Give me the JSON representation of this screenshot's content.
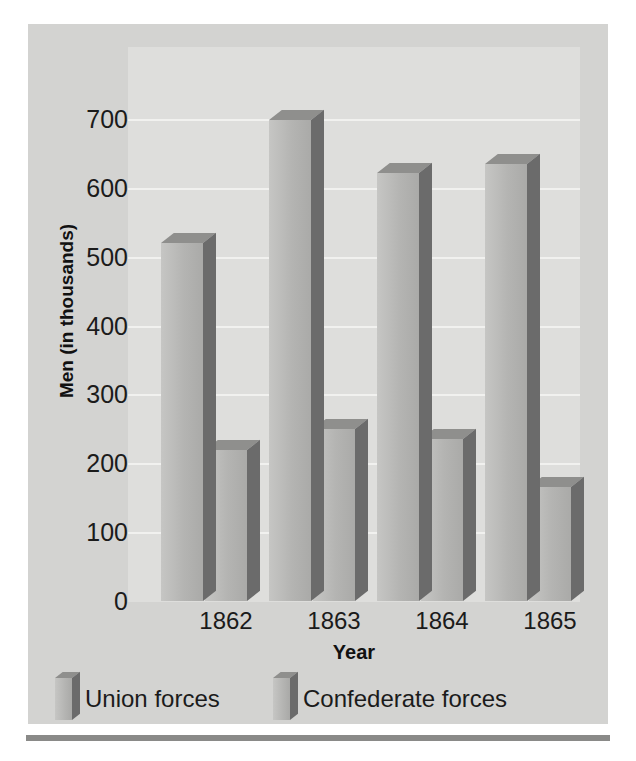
{
  "chart_data": {
    "type": "bar",
    "title": "",
    "xlabel": "Year",
    "ylabel": "Men (in thousands)",
    "categories": [
      "1862",
      "1863",
      "1864",
      "1865"
    ],
    "series": [
      {
        "name": "Union forces",
        "values": [
          520,
          698,
          622,
          634
        ]
      },
      {
        "name": "Confederate forces",
        "values": [
          220,
          250,
          235,
          165
        ]
      }
    ],
    "ylim": [
      0,
      700
    ],
    "yticks": [
      0,
      100,
      200,
      300,
      400,
      500,
      600,
      700
    ],
    "ytick_labels": [
      "0",
      "100",
      "200",
      "300",
      "400",
      "500",
      "600",
      "700"
    ],
    "grid": true,
    "legend_position": "bottom-left",
    "style": "3d-column",
    "colors": {
      "bar_face": "#b4b4b2",
      "bar_side": "#6b6b6b",
      "bar_top": "#8f8f8d",
      "plot_background": "#dededc",
      "card_background": "#d3d3d1",
      "gridline": "#f1f1ef",
      "text": "#1b1b1b"
    }
  }
}
